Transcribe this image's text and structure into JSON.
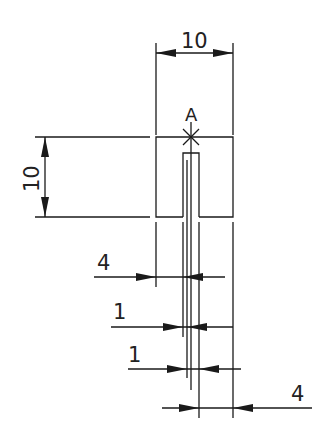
{
  "drawing": {
    "title": "Slotted square with dimensions",
    "point_label": "A",
    "point_marker": "cross-icon",
    "colors": {
      "line": "#1a1a1a",
      "text": "#222222",
      "background": "#ffffff"
    }
  },
  "dimensions": {
    "top_width": {
      "value": "10",
      "orientation": "horizontal"
    },
    "left_height": {
      "value": "10",
      "orientation": "vertical"
    },
    "dim_4_upper": {
      "value": "4",
      "orientation": "horizontal"
    },
    "dim_1_upper": {
      "value": "1",
      "orientation": "horizontal"
    },
    "dim_1_lower": {
      "value": "1",
      "orientation": "horizontal"
    },
    "dim_4_lower": {
      "value": "4",
      "orientation": "horizontal"
    }
  }
}
